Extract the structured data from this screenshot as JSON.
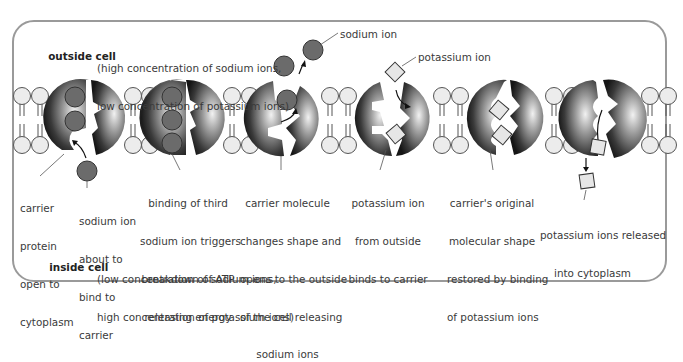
{
  "diagram": {
    "outside": {
      "label": "outside cell",
      "line1": "(high concentration of sodium ions,",
      "line2": "low concentration of potassium ions)"
    },
    "inside": {
      "label": "inside cell",
      "line1": "(low concentration of sodium ions,",
      "line2": "high concentration of potassium ions)"
    },
    "callouts": {
      "sodium_ion": "sodium ion",
      "potassium_ion": "potassium ion"
    },
    "steps": [
      {
        "lines": [
          "carrier",
          "protein",
          "open to",
          "cytoplasm"
        ]
      },
      {
        "lines": [
          "sodium ion",
          "about to",
          "bind to",
          "carrier"
        ]
      },
      {
        "lines": [
          "binding of third",
          "sodium ion triggers",
          "breakdown of ATP",
          "releasing energy"
        ]
      },
      {
        "lines": [
          "carrier molecule",
          "changes shape and",
          "opens to the outside",
          "of the cell releasing",
          "sodium ions"
        ]
      },
      {
        "lines": [
          "potassium ion",
          "from outside",
          "binds to carrier"
        ]
      },
      {
        "lines": [
          "carrier's original",
          "molecular shape",
          "restored by binding",
          "of potassium ions"
        ]
      },
      {
        "lines": [
          "potassium ions released",
          "into cytoplasm"
        ]
      }
    ],
    "colors": {
      "frame": "#9a9a9a",
      "sodium_ion": "#6b6b6b",
      "potassium_ion": "#e6e6e6",
      "lipid_head": "#ececec",
      "carrier_dark": "#1e1e1e",
      "carrier_light": "#d8d8d8"
    }
  }
}
